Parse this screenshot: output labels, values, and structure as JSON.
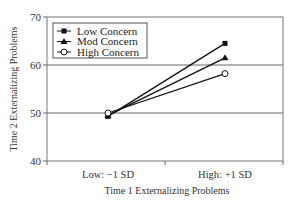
{
  "chart_data": {
    "type": "line",
    "title": "",
    "xlabel": "Time 1 Externalizing Problems",
    "ylabel": "Time 2 Externalizing Problems",
    "categories": [
      "Low: −1 SD",
      "High: +1 SD"
    ],
    "yticks": [
      "40",
      "50",
      "60",
      "70"
    ],
    "ylim": [
      40,
      70
    ],
    "grid": "horizontal at 50 and 60",
    "legend_position": "top-left inside",
    "series": [
      {
        "name": "Low Concern",
        "marker": "square-filled",
        "values": [
          49.3,
          64.5
        ]
      },
      {
        "name": "Mod Concern",
        "marker": "triangle-filled",
        "values": [
          49.5,
          61.5
        ]
      },
      {
        "name": "High Concern",
        "marker": "circle-open",
        "values": [
          50.0,
          58.2
        ]
      }
    ]
  }
}
